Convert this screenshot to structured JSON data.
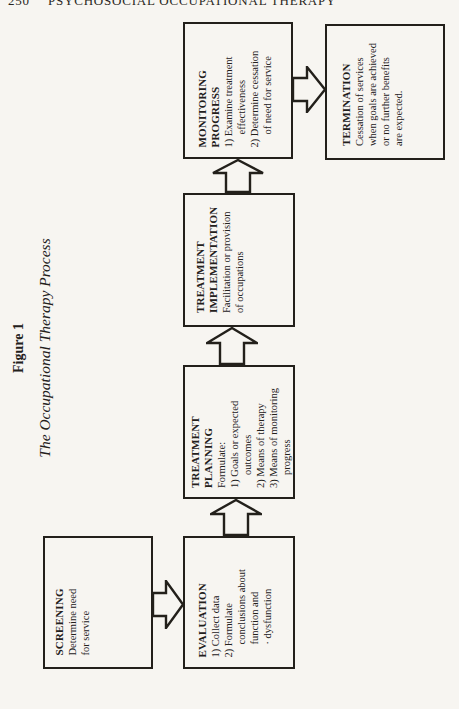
{
  "page": {
    "page_number": "250",
    "running_title": "PSYCHOSOCIAL OCCUPATIONAL THERAPY",
    "figure_label": "Figure 1",
    "figure_title": "The Occupational Therapy Process"
  },
  "colors": {
    "paper": "#f7f5f1",
    "ink": "#23201b"
  },
  "diagram": {
    "type": "flowchart",
    "orientation": "landscape figure rotated 90° on portrait page, text reads bottom-to-top",
    "flow_order": [
      "SCREENING",
      "EVALUATION",
      "TREATMENT PLANNING",
      "TREATMENT IMPLEMENTATION",
      "MONITORING PROGRESS",
      "TERMINATION"
    ],
    "boxes": [
      {
        "name": "screening",
        "lines": [
          "SCREENING",
          "Determine need",
          "for service"
        ]
      },
      {
        "name": "evaluation",
        "lines": [
          "EVALUATION",
          "1) Collect data",
          "2) Formulate",
          "conclusions about",
          "function and",
          "· dysfunction"
        ]
      },
      {
        "name": "treatment-planning",
        "lines": [
          "TREATMENT",
          "PLANNING",
          "Formulate:",
          "1) Goals or expected",
          "outcomes",
          "2) Means of therapy",
          "3) Means of monitoring",
          "progress"
        ]
      },
      {
        "name": "treatment-implementation",
        "lines": [
          "TREATMENT",
          "IMPLEMENTATION",
          "Facilitation or provision",
          "of occupations"
        ]
      },
      {
        "name": "monitoring-progress",
        "lines": [
          "MONITORING",
          "PROGRESS",
          "1) Examine treatment",
          "effectiveness",
          "2) Determine cessation",
          "of need for service"
        ]
      },
      {
        "name": "termination",
        "lines": [
          "TERMINATION",
          "Cessation of services",
          "when goals are achieved",
          "or no further benefits",
          "are expected."
        ]
      }
    ],
    "arrows": [
      {
        "from": "screening",
        "to": "evaluation",
        "direction": "right"
      },
      {
        "from": "evaluation",
        "to": "treatment-planning",
        "direction": "up"
      },
      {
        "from": "treatment-planning",
        "to": "treatment-implementation",
        "direction": "up"
      },
      {
        "from": "treatment-implementation",
        "to": "monitoring-progress",
        "direction": "up"
      },
      {
        "from": "monitoring-progress",
        "to": "termination",
        "direction": "right"
      }
    ]
  }
}
